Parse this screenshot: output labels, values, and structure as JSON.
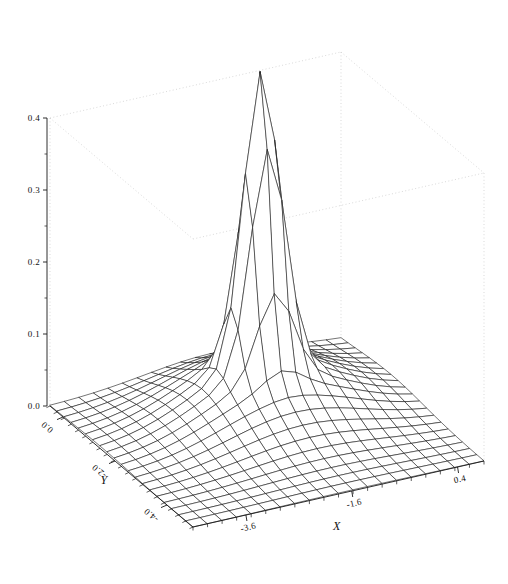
{
  "chart_data": {
    "type": "surface",
    "title": "",
    "subtitle": "",
    "xlabel": "X",
    "ylabel": "Y",
    "zlabel": "",
    "grid": false,
    "legend": "none",
    "projection": "3d-wireframe",
    "surface_function": "gaussian-peak",
    "mesh": {
      "nx": 20,
      "ny": 20
    },
    "xlim": [
      -4.6,
      0.9
    ],
    "ylim": [
      -5.0,
      0.5
    ],
    "zlim": [
      0.0,
      0.4
    ],
    "x_ticks": [
      -3.6,
      -1.6,
      0.4
    ],
    "x_tick_labels": [
      "-3.6",
      "-1.6",
      "0.4"
    ],
    "y_ticks": [
      0.0,
      -2.0,
      -4.0
    ],
    "y_tick_labels": [
      "0.0",
      "-2.0",
      "-4.0"
    ],
    "z_ticks": [
      0.0,
      0.1,
      0.2,
      0.3,
      0.4
    ],
    "z_tick_labels": [
      "0.0",
      "0.1",
      "0.2",
      "0.3",
      "0.4"
    ],
    "z_minor_ticks": [
      0.05,
      0.15,
      0.25,
      0.35
    ],
    "peak": {
      "x": -1.55,
      "y": -1.45,
      "z": 0.4
    },
    "peak_sigma_x": 0.33,
    "peak_sigma_y": 0.33,
    "base_level": 0.0,
    "broad_sigma_x": 1.25,
    "broad_sigma_y": 1.25,
    "broad_amplitude": 0.075,
    "colors": {
      "background": "#ffffff",
      "mesh": "#202020",
      "axis": "#1a1a1a",
      "box_dotted": "#c8c8c8",
      "text": "#111111"
    }
  },
  "axes": {
    "x_title": "X",
    "y_title": "Y"
  }
}
